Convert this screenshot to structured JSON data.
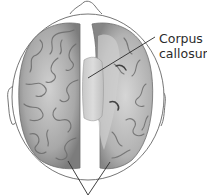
{
  "diagram": {
    "labels": [
      {
        "id": "corpus-callosum",
        "lines": [
          "Corpus",
          "callosum"
        ]
      }
    ],
    "pointers": [
      {
        "target": "left-hemisphere"
      },
      {
        "target": "right-hemisphere"
      }
    ]
  },
  "colors": {
    "outline": "#555555",
    "brain_fill": "#b8b8b8",
    "brain_shadow": "#7a7a7a",
    "callosum_fill": "#d4d4d4",
    "text": "#2b2b2b"
  }
}
